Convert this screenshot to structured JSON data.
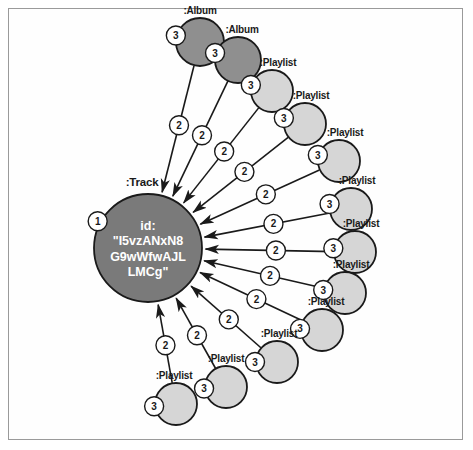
{
  "diagram": {
    "type": "graph-visualization",
    "title_node": ":Track",
    "background_color": "#ffffff",
    "frame_color": "#9a9a9a"
  },
  "colors": {
    "track_fill": "#7a7a7a",
    "album_fill": "#8f8f8f",
    "playlist_fill": "#d6d6d6",
    "node_stroke": "#1a1a1a",
    "edge_stroke": "#1a1a1a",
    "badge_fill": "#ffffff",
    "center_text": "#ffffff"
  },
  "center_node": {
    "label": ":Track",
    "badge": "1",
    "id_key": "id:",
    "id_lines": [
      "id:",
      "\"I5vzANxN8",
      "G9wWfwAJL",
      "LMCg\""
    ],
    "cx": 148,
    "cy": 248,
    "r": 54
  },
  "nodes": [
    {
      "label": ":Album",
      "badge": "3",
      "cx": 200,
      "cy": 42,
      "r": 24,
      "kind": "album",
      "label_dx": 0,
      "label_dy": -32,
      "badge_angle": 195
    },
    {
      "label": ":Album",
      "badge": "3",
      "cx": 238,
      "cy": 60,
      "r": 23,
      "kind": "album",
      "label_dx": 4,
      "label_dy": -31,
      "badge_angle": 197
    },
    {
      "label": ":Playlist",
      "badge": "3",
      "cx": 272,
      "cy": 91,
      "r": 21,
      "kind": "playlist",
      "label_dx": 6,
      "label_dy": -29,
      "badge_angle": 196
    },
    {
      "label": ":Playlist",
      "badge": "3",
      "cx": 305,
      "cy": 124,
      "r": 21,
      "kind": "playlist",
      "label_dx": 6,
      "label_dy": -29,
      "badge_angle": 196
    },
    {
      "label": ":Playlist",
      "badge": "3",
      "cx": 339,
      "cy": 161,
      "r": 21,
      "kind": "playlist",
      "label_dx": 6,
      "label_dy": -29,
      "badge_angle": 196
    },
    {
      "label": ":Playlist",
      "badge": "3",
      "cx": 351,
      "cy": 209,
      "r": 21,
      "kind": "playlist",
      "label_dx": 6,
      "label_dy": -29,
      "badge_angle": 193
    },
    {
      "label": ":Playlist",
      "badge": "3",
      "cx": 355,
      "cy": 252,
      "r": 21,
      "kind": "playlist",
      "label_dx": 6,
      "label_dy": -29,
      "badge_angle": 190
    },
    {
      "label": ":Playlist",
      "badge": "3",
      "cx": 345,
      "cy": 293,
      "r": 21,
      "kind": "playlist",
      "label_dx": 6,
      "label_dy": -29,
      "badge_angle": 188
    },
    {
      "label": ":Playlist",
      "badge": "3",
      "cx": 322,
      "cy": 330,
      "r": 21,
      "kind": "playlist",
      "label_dx": 4,
      "label_dy": -29,
      "badge_angle": 183
    },
    {
      "label": ":Playlist",
      "badge": "3",
      "cx": 277,
      "cy": 362,
      "r": 21,
      "kind": "playlist",
      "label_dx": 2,
      "label_dy": -29,
      "badge_angle": 180
    },
    {
      "label": ":Playlist",
      "badge": "3",
      "cx": 226,
      "cy": 387,
      "r": 21,
      "kind": "playlist",
      "label_dx": 0,
      "label_dy": -29,
      "badge_angle": 176
    },
    {
      "label": ":Playlist",
      "badge": "3",
      "cx": 176,
      "cy": 404,
      "r": 21,
      "kind": "playlist",
      "label_dx": -2,
      "label_dy": -29,
      "badge_angle": 174
    }
  ],
  "edges": [
    {
      "from": 0,
      "badge": "2",
      "badge_t": 0.47
    },
    {
      "from": 1,
      "badge": "2",
      "badge_t": 0.47
    },
    {
      "from": 2,
      "badge": "2",
      "badge_t": 0.46
    },
    {
      "from": 3,
      "badge": "2",
      "badge_t": 0.46
    },
    {
      "from": 4,
      "badge": "2",
      "badge_t": 0.45
    },
    {
      "from": 5,
      "badge": "2",
      "badge_t": 0.45
    },
    {
      "from": 6,
      "badge": "2",
      "badge_t": 0.45
    },
    {
      "from": 7,
      "badge": "2",
      "badge_t": 0.45
    },
    {
      "from": 8,
      "badge": "2",
      "badge_t": 0.45
    },
    {
      "from": 9,
      "badge": "2",
      "badge_t": 0.46
    },
    {
      "from": 10,
      "badge": "2",
      "badge_t": 0.47
    },
    {
      "from": 11,
      "badge": "2",
      "badge_t": 0.48
    }
  ],
  "edge_badge_radius": 9.5,
  "node_badge_radius": 9.5
}
